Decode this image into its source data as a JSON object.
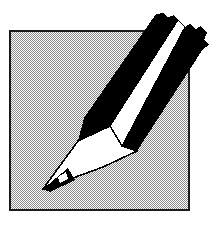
{
  "image": {
    "title": "Pencil clip art icon",
    "width": 213,
    "height": 232,
    "style": "monochrome bitmap clip art, 1-bit dithered shading",
    "background_color": "#ffffff"
  },
  "frame": {
    "name": "square picture frame",
    "fill_description": "50% dithered gray checkerboard",
    "fill_color": "#a8a8a8",
    "border_color": "#1a1a1a",
    "border_width": 2,
    "x": 9,
    "y": 30,
    "width": 181,
    "height": 181
  },
  "pencil": {
    "name": "sharpened pencil",
    "orientation": "diagonal, tip at lower-left, blunt cut end at upper-right",
    "body_color": "#000000",
    "stripe_color": "#ffffff",
    "wood_color": "#ffffff",
    "lead_color": "#000000",
    "outline_color": "#000000",
    "parts": [
      {
        "label": "upper black stripe",
        "color": "#000000"
      },
      {
        "label": "center white stripe",
        "color": "#ffffff"
      },
      {
        "label": "lower black stripe",
        "color": "#000000"
      },
      {
        "label": "sharpened wood cone",
        "color": "#ffffff"
      },
      {
        "label": "graphite lead tip",
        "color": "#000000"
      },
      {
        "label": "lead highlight",
        "color": "#ffffff"
      }
    ],
    "tip_point_x": 40,
    "tip_point_y": 190
  },
  "colors": {
    "black": "#000000",
    "white": "#ffffff",
    "gray_dither": "#a8a8a8",
    "frame_border": "#1a1a1a"
  }
}
